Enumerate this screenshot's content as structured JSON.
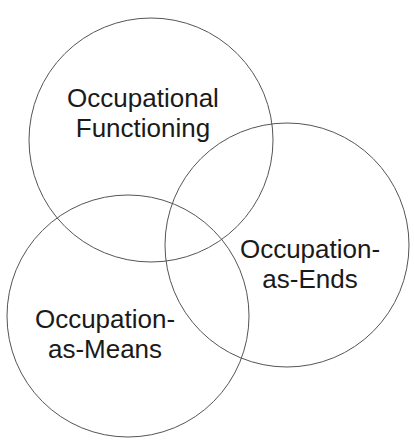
{
  "diagram": {
    "type": "venn",
    "background": "#ffffff",
    "stroke_color": "#555555",
    "text_color": "#1a1a1a",
    "circles": [
      {
        "id": "occupational-functioning",
        "cx": 151,
        "cy": 140,
        "r": 122,
        "lines": [
          "Occupational",
          "Functioning"
        ],
        "label_x": 143,
        "label_y": [
          107,
          137
        ]
      },
      {
        "id": "occupation-as-ends",
        "cx": 287,
        "cy": 245,
        "r": 122,
        "lines": [
          "Occupation-",
          "as-Ends"
        ],
        "label_x": 310,
        "label_y": [
          258,
          288
        ]
      },
      {
        "id": "occupation-as-means",
        "cx": 128,
        "cy": 316,
        "r": 121,
        "lines": [
          "Occupation-",
          "as-Means"
        ],
        "label_x": 105,
        "label_y": [
          328,
          358
        ]
      }
    ]
  }
}
